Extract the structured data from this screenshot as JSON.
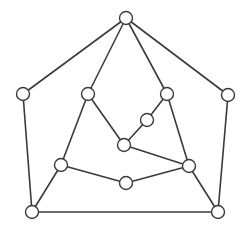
{
  "diagram": {
    "type": "graph",
    "background": "#ffffff",
    "stroke_color": "#3a3a3a",
    "node_fill": "#ffffff",
    "node_radius": 6.5,
    "nodes": [
      {
        "id": "top",
        "x": 126,
        "y": 18
      },
      {
        "id": "outer-left",
        "x": 23,
        "y": 94
      },
      {
        "id": "outer-right",
        "x": 228,
        "y": 95
      },
      {
        "id": "inner-left",
        "x": 88,
        "y": 94
      },
      {
        "id": "inner-right",
        "x": 167,
        "y": 94
      },
      {
        "id": "mid-small",
        "x": 147,
        "y": 120
      },
      {
        "id": "center",
        "x": 124,
        "y": 145
      },
      {
        "id": "lower-left",
        "x": 61,
        "y": 165
      },
      {
        "id": "lower-right",
        "x": 189,
        "y": 166
      },
      {
        "id": "bottom-mid",
        "x": 126,
        "y": 183
      },
      {
        "id": "bottom-left",
        "x": 32,
        "y": 212
      },
      {
        "id": "bottom-right",
        "x": 218,
        "y": 212
      }
    ],
    "edges": [
      [
        "top",
        "outer-left"
      ],
      [
        "top",
        "outer-right"
      ],
      [
        "top",
        "inner-left"
      ],
      [
        "top",
        "inner-right"
      ],
      [
        "outer-left",
        "bottom-left"
      ],
      [
        "outer-right",
        "bottom-right"
      ],
      [
        "inner-left",
        "center"
      ],
      [
        "inner-left",
        "lower-left"
      ],
      [
        "inner-right",
        "mid-small"
      ],
      [
        "inner-right",
        "lower-right"
      ],
      [
        "mid-small",
        "center"
      ],
      [
        "center",
        "lower-right"
      ],
      [
        "lower-left",
        "bottom-mid"
      ],
      [
        "bottom-mid",
        "lower-right"
      ],
      [
        "lower-left",
        "bottom-left"
      ],
      [
        "lower-right",
        "bottom-right"
      ],
      [
        "bottom-left",
        "bottom-right"
      ]
    ]
  }
}
